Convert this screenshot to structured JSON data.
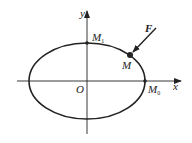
{
  "diagram": {
    "axes": {
      "x_label": "x",
      "y_label": "y",
      "origin_label": "O"
    },
    "points": {
      "M1": {
        "label": "M",
        "subscript": "1"
      },
      "M": {
        "label": "M"
      },
      "M0": {
        "label": "M",
        "subscript": "0"
      }
    },
    "force": {
      "label": "F"
    },
    "colors": {
      "stroke": "#222222",
      "background": "#ffffff"
    }
  }
}
